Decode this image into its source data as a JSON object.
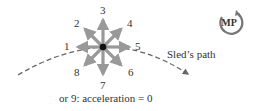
{
  "diagram": {
    "center": {
      "x": 103,
      "y": 47
    },
    "arrow_color": "#999999",
    "dot_color": "#111111",
    "arrows": [
      {
        "label": "1",
        "direction": "left"
      },
      {
        "label": "2",
        "direction": "up-left"
      },
      {
        "label": "3",
        "direction": "up"
      },
      {
        "label": "4",
        "direction": "up-right"
      },
      {
        "label": "5",
        "direction": "right"
      },
      {
        "label": "6",
        "direction": "down-right"
      },
      {
        "label": "7",
        "direction": "down"
      },
      {
        "label": "8",
        "direction": "down-left"
      }
    ],
    "caption": "or 9: acceleration = 0",
    "path_label": "Sled’s path",
    "badge": {
      "text": "MP",
      "color": "#666666"
    }
  }
}
